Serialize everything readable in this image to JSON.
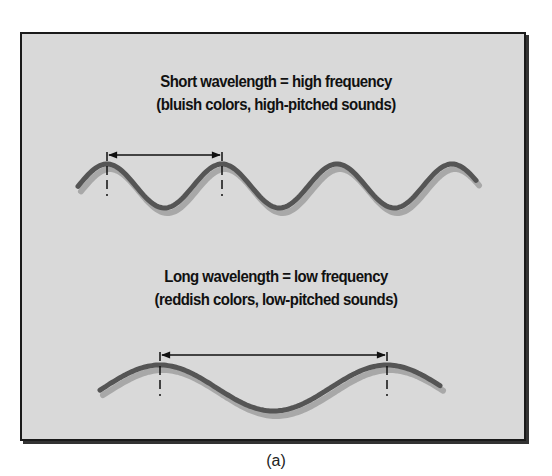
{
  "figure": {
    "label": "(a)",
    "panel_color": "#d9d9d9",
    "wave_color": "#555555",
    "shadow_color": "#aaaaaa"
  },
  "short_wave": {
    "title": "Short wavelength = high frequency",
    "subtitle": "(bluish colors, high-pitched sounds)",
    "wavelength_px": 115,
    "amplitude_px": 22,
    "cycles_shown": 4
  },
  "long_wave": {
    "title": "Long wavelength = low frequency",
    "subtitle": "(reddish colors, low-pitched sounds)",
    "wavelength_px": 227,
    "amplitude_px": 23,
    "cycles_shown": 1.5
  }
}
